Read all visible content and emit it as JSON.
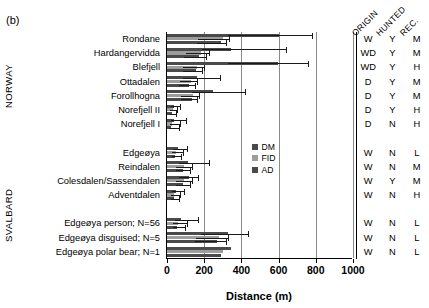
{
  "panel_label": "(b)",
  "groups": [
    {
      "name": "NORWAY"
    },
    {
      "name": "SVALBARD"
    }
  ],
  "legend": {
    "position": "inside-center-right",
    "items": [
      {
        "label": "DM",
        "color": "#4a4a4a"
      },
      {
        "label": "FID",
        "color": "#9d9d9d"
      },
      {
        "label": "AD",
        "color": "#4a4a4a"
      }
    ]
  },
  "attr_headers": [
    "ORIGIN",
    "HUNTED",
    "REC."
  ],
  "chart_data": {
    "type": "bar",
    "orientation": "horizontal",
    "title": "",
    "xlabel": "Distance (m)",
    "ylabel": "",
    "xlim": [
      0,
      1000
    ],
    "xticks": [
      0,
      200,
      400,
      600,
      800,
      1000
    ],
    "grid": true,
    "categories": [
      "Rondane",
      "Hardangervidda",
      "Blefjell",
      "Ottadalen",
      "Forollhogna",
      "Norefjell II",
      "Norefjell I",
      "",
      "Edgeøya",
      "Reindalen",
      "Colesdalen/Sassendalen",
      "Adventdalen",
      "",
      "Edgeøya person; N=56",
      "Edgeøya disguised; N=5",
      "Edgeøya polar bear; N=1"
    ],
    "series": [
      {
        "name": "DM",
        "values": [
          600,
          345,
          595,
          160,
          245,
          40,
          35,
          null,
          60,
          115,
          120,
          50,
          null,
          75,
          330,
          345
        ],
        "error_upper": [
          780,
          640,
          760,
          290,
          420,
          75,
          105,
          null,
          110,
          230,
          170,
          95,
          null,
          170,
          440,
          null
        ]
      },
      {
        "name": "FID",
        "values": [
          300,
          185,
          160,
          130,
          140,
          30,
          25,
          null,
          50,
          90,
          90,
          40,
          null,
          60,
          280,
          300
        ],
        "error_upper": [
          335,
          230,
          200,
          165,
          175,
          55,
          75,
          null,
          90,
          135,
          135,
          70,
          null,
          110,
          330,
          null
        ]
      },
      {
        "name": "AD",
        "values": [
          290,
          170,
          155,
          120,
          135,
          25,
          22,
          null,
          45,
          85,
          85,
          38,
          null,
          55,
          270,
          290
        ],
        "error_upper": [
          320,
          215,
          190,
          155,
          165,
          50,
          65,
          null,
          80,
          125,
          125,
          65,
          null,
          100,
          320,
          null
        ]
      }
    ],
    "attributes": [
      {
        "origin": "W",
        "hunted": "Y",
        "rec": "M"
      },
      {
        "origin": "WD",
        "hunted": "Y",
        "rec": "M"
      },
      {
        "origin": "WD",
        "hunted": "Y",
        "rec": "H"
      },
      {
        "origin": "D",
        "hunted": "Y",
        "rec": "M"
      },
      {
        "origin": "D",
        "hunted": "Y",
        "rec": "M"
      },
      {
        "origin": "D",
        "hunted": "Y",
        "rec": "H"
      },
      {
        "origin": "D",
        "hunted": "N",
        "rec": "H"
      },
      {
        "origin": "",
        "hunted": "",
        "rec": ""
      },
      {
        "origin": "W",
        "hunted": "N",
        "rec": "L"
      },
      {
        "origin": "W",
        "hunted": "N",
        "rec": "M"
      },
      {
        "origin": "W",
        "hunted": "Y",
        "rec": "M"
      },
      {
        "origin": "W",
        "hunted": "N",
        "rec": "H"
      },
      {
        "origin": "",
        "hunted": "",
        "rec": ""
      },
      {
        "origin": "W",
        "hunted": "N",
        "rec": "L"
      },
      {
        "origin": "W",
        "hunted": "N",
        "rec": "L"
      },
      {
        "origin": "W",
        "hunted": "N",
        "rec": "L"
      }
    ]
  }
}
